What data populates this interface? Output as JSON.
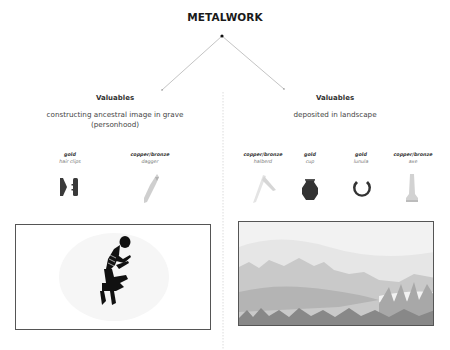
{
  "diagram": {
    "title": "METALWORK",
    "branches": [
      {
        "heading": "Valuables",
        "description_lines": [
          "constructing ancestral image in grave",
          "(personhood)"
        ],
        "items": [
          {
            "material": "gold",
            "name": "hair clips",
            "icon": "hair-clips-icon"
          },
          {
            "material": "copper/bronze",
            "name": "dagger",
            "icon": "dagger-icon"
          }
        ],
        "image": "crouched-skeleton-burial-image"
      },
      {
        "heading": "Valuables",
        "description_lines": [
          "deposited in landscape"
        ],
        "items": [
          {
            "material": "copper/bronze",
            "name": "halberd",
            "icon": "halberd-icon"
          },
          {
            "material": "gold",
            "name": "cup",
            "icon": "cup-icon"
          },
          {
            "material": "gold",
            "name": "lunula",
            "icon": "lunula-icon"
          },
          {
            "material": "copper/bronze",
            "name": "axe",
            "icon": "axe-icon"
          }
        ],
        "image": "wetland-landscape-image"
      }
    ],
    "colors": {
      "gold_objects": "#3a3a3a",
      "copper_bronze_objects": "#c8c8c8",
      "connector": "#bdbdbd"
    }
  }
}
